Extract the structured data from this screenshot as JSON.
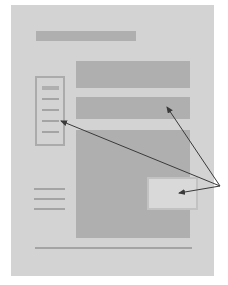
{
  "diagram": {
    "type": "wireframe-layout",
    "colors": {
      "background": "#ffffff",
      "page": "#d3d3d3",
      "block": "#afafaf",
      "line": "#a4a4a4",
      "overlay": "#d9d9d9",
      "arrow": "#3a3a3a"
    },
    "elements": {
      "header_bar": {
        "x": 36,
        "y": 31,
        "w": 100,
        "h": 10
      },
      "content_block_top": {
        "x": 76,
        "y": 61,
        "w": 114,
        "h": 27
      },
      "content_block_second": {
        "x": 76,
        "y": 97,
        "w": 114,
        "h": 22
      },
      "sidebar_box": {
        "x": 35,
        "y": 76,
        "w": 30,
        "h": 70,
        "item_count": 5
      },
      "main_block": {
        "x": 76,
        "y": 130,
        "w": 114,
        "h": 108
      },
      "overlay_box": {
        "x": 147,
        "y": 177,
        "w": 51,
        "h": 33
      },
      "left_lines": {
        "count": 3,
        "x": 34,
        "w": 31,
        "ys": [
          188,
          198,
          208
        ]
      },
      "footer_line": {
        "x": 35,
        "y": 247,
        "w": 157
      }
    },
    "arrows": {
      "origin": [
        220,
        186
      ],
      "targets": [
        {
          "name": "to-second-block",
          "to": [
            166,
            106
          ]
        },
        {
          "name": "to-sidebar",
          "to": [
            60,
            121
          ]
        },
        {
          "name": "to-overlay",
          "to": [
            178,
            194
          ]
        }
      ]
    }
  }
}
